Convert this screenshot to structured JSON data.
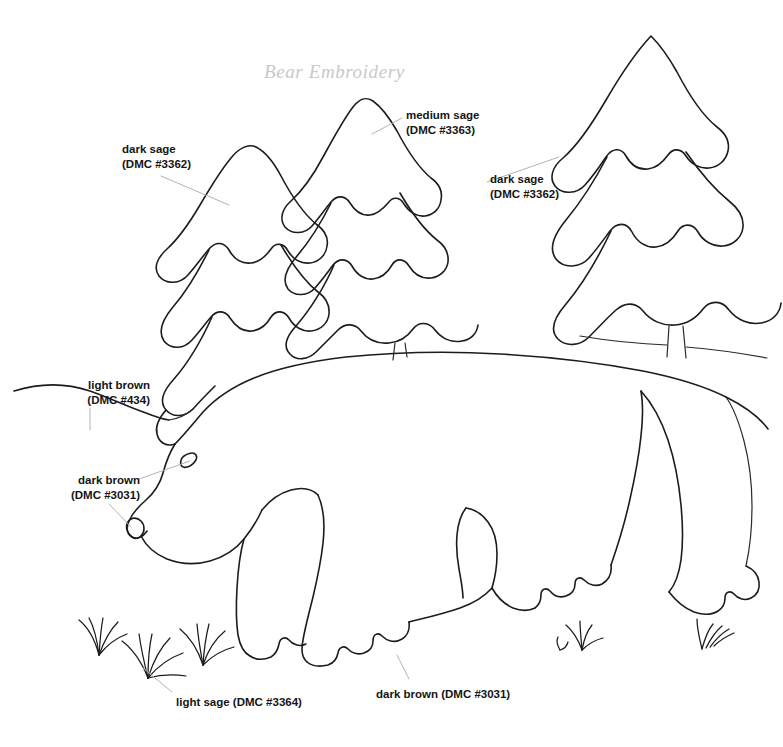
{
  "document": {
    "title": "Bear Embroidery",
    "type": "embroidery-pattern-line-drawing",
    "background_color": "#ffffff",
    "ink_color": "#1c1c1c",
    "leader_line_color": "#b3b3b3",
    "title_color": "#c9c9c9"
  },
  "labels": {
    "dark_sage_left": {
      "name": "dark sage",
      "code": "(DMC #3362)",
      "x": 122,
      "y": 142
    },
    "medium_sage": {
      "name": "medium sage",
      "code": "(DMC #3363)",
      "x": 406,
      "y": 108
    },
    "dark_sage_right": {
      "name": "dark sage",
      "code": "(DMC #3362)",
      "x": 490,
      "y": 172
    },
    "light_brown": {
      "name": "light brown",
      "code": "(DMC #434)",
      "x": 62,
      "y": 378
    },
    "dark_brown_head": {
      "name": "dark brown",
      "code": "(DMC #3031)",
      "x": 54,
      "y": 473
    },
    "light_sage_grass": {
      "name": "light sage (DMC #3364)",
      "code": "",
      "x": 176,
      "y": 695
    },
    "dark_brown_paw": {
      "name": "dark brown (DMC #3031)",
      "code": "",
      "x": 376,
      "y": 687
    }
  },
  "motifs": {
    "tree_back_left": "dark sage pine tree, left rear",
    "tree_center": "medium sage pine tree, center",
    "tree_right": "dark sage pine tree, right",
    "bear": "walking bear outline facing left",
    "bear_eye": "small leaf-shaped eye",
    "bear_nose": "small nose loop at muzzle tip",
    "ground_line": "light brown ground / hillside line",
    "grass_tufts": "light sage grass tufts along the ground"
  }
}
